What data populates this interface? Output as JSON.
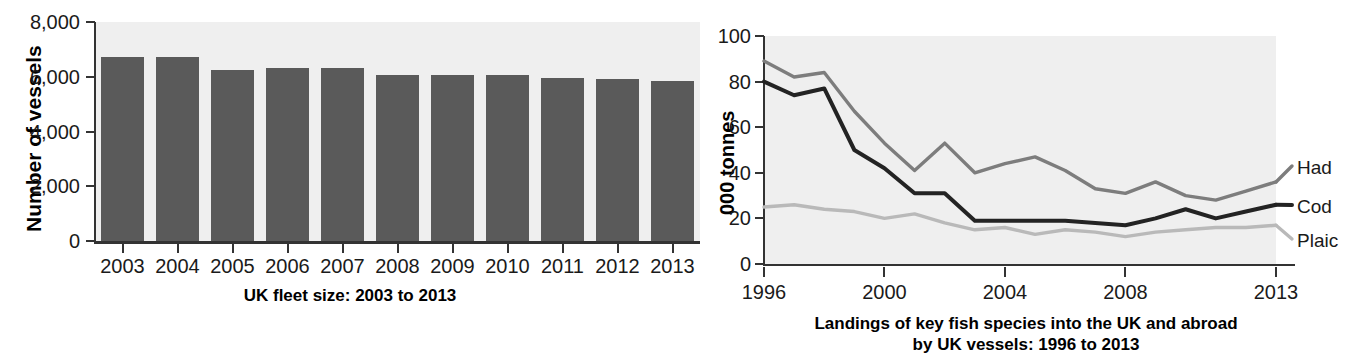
{
  "chart_data": [
    {
      "type": "bar",
      "title": "UK fleet size: 2003 to 2013",
      "xlabel": "",
      "ylabel": "Number of vessels",
      "categories": [
        "2003",
        "2004",
        "2005",
        "2006",
        "2007",
        "2008",
        "2009",
        "2010",
        "2011",
        "2012",
        "2013"
      ],
      "values": [
        6720,
        6720,
        6240,
        6330,
        6330,
        6060,
        6060,
        6060,
        5940,
        5930,
        5850
      ],
      "ylim": [
        0,
        8000
      ],
      "ytick_labels": [
        "0",
        "2,000",
        "4,000",
        "6,000",
        "8,000"
      ],
      "ytick_values": [
        0,
        2000,
        4000,
        6000,
        8000
      ],
      "grid": false,
      "legend": "none",
      "bar_color": "#5a5a5a",
      "plot_background": "#efefef"
    },
    {
      "type": "line",
      "title": "Landings of key fish species into the UK and abroad by UK vessels: 1996 to 2013",
      "title_line1": "Landings of key fish species into the UK and abroad",
      "title_line2": "by UK vessels: 1996 to 2013",
      "xlabel": "",
      "ylabel": "000 tonnes",
      "x": [
        1996,
        1997,
        1998,
        1999,
        2000,
        2001,
        2002,
        2003,
        2004,
        2005,
        2006,
        2007,
        2008,
        2009,
        2010,
        2011,
        2012,
        2013
      ],
      "xlim": [
        1996,
        2013
      ],
      "ylim": [
        0,
        100
      ],
      "ytick_labels": [
        "0",
        "20",
        "40",
        "60",
        "80",
        "100"
      ],
      "ytick_values": [
        0,
        20,
        40,
        60,
        80,
        100
      ],
      "xtick_labels": [
        "1996",
        "2000",
        "2004",
        "2008",
        "2013"
      ],
      "xtick_values": [
        1996,
        2000,
        2004,
        2008,
        2013
      ],
      "grid": false,
      "legend_position": "right",
      "plot_background": "#efefef",
      "series": [
        {
          "name": "Haddock",
          "label_truncated": "Had",
          "color": "#7d7d7d",
          "values": [
            89,
            82,
            84,
            67,
            53,
            41,
            53,
            40,
            44,
            47,
            41,
            33,
            31,
            36,
            30,
            28,
            32,
            36
          ]
        },
        {
          "name": "Cod",
          "label_truncated": "Cod",
          "color": "#232323",
          "values": [
            80,
            74,
            77,
            50,
            42,
            31,
            31,
            19,
            19,
            19,
            19,
            18,
            17,
            20,
            24,
            20,
            23,
            26
          ]
        },
        {
          "name": "Plaice",
          "label_truncated": "Plaic",
          "color": "#b9b9b9",
          "values": [
            25,
            26,
            24,
            23,
            20,
            22,
            18,
            15,
            16,
            13,
            15,
            14,
            12,
            14,
            15,
            16,
            16,
            17
          ]
        }
      ]
    }
  ],
  "bar_chart": {
    "y_axis_title": "Number of vessels",
    "caption": "UK fleet size: 2003 to 2013"
  },
  "line_chart": {
    "y_axis_title": "000 tonnes",
    "caption_line1": "Landings of key fish species into the UK and abroad",
    "caption_line2": "by UK vessels: 1996 to 2013",
    "legend": {
      "haddock": "Had",
      "cod": "Cod",
      "plaice": "Plaic"
    }
  },
  "clipped_top_text": ""
}
